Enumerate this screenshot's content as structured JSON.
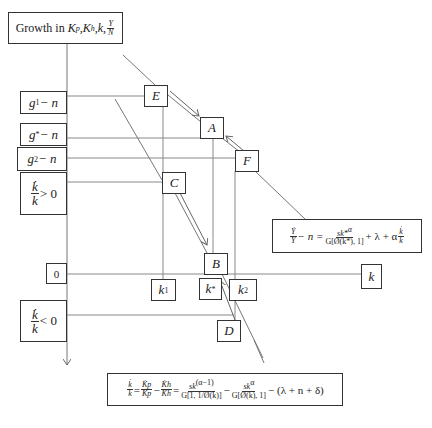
{
  "title": {
    "text_prefix": "Growth in ",
    "vars": "K",
    "sub_p": "p",
    "sub_h": "h",
    "k": "k",
    "frac_num": "Y",
    "frac_den": "N"
  },
  "axis_labels": {
    "g1": {
      "base": "g",
      "sup": "1",
      "rest": " − n"
    },
    "gstar": {
      "base": "g",
      "sup": "*",
      "rest": " − n"
    },
    "g2": {
      "base": "g",
      "sup": "2",
      "rest": " − n"
    },
    "kpos": {
      "num": "k̇",
      "den": "k",
      "rel": "> 0"
    },
    "zero": "0",
    "kneg": {
      "num": "k̇",
      "den": "k",
      "rel": "< 0"
    }
  },
  "points": {
    "E": "E",
    "A": "A",
    "F": "F",
    "C": "C",
    "B": "B",
    "D": "D"
  },
  "k_labels": {
    "k1": {
      "base": "k",
      "sup": "1"
    },
    "kstar": {
      "base": "k",
      "sup": "*"
    },
    "k2": {
      "base": "k",
      "sup": "2"
    },
    "k": "k"
  },
  "equations": {
    "y_growth": {
      "lhs_num": "Ẏ",
      "lhs_den": "Y",
      "minus_n": " − n = ",
      "frac_num": "sk*",
      "frac_num_sup": "α",
      "frac_den": "G[Ø(k*), 1]",
      "tail": " + λ + α",
      "tail_num": "k̇",
      "tail_den": "k"
    },
    "k_growth": {
      "lhs_num": "k̇",
      "lhs_den": "k",
      "kp_num": "K̇p",
      "kp_den": "Kp",
      "kh_num": "K̇h",
      "kh_den": "Kh",
      "term1_num": "sk",
      "term1_sup": "(α−1)",
      "term1_den": "G[1, 1/Ø(k)]",
      "term2_num": "sk",
      "term2_sup": "α",
      "term2_den": "G[Ø(k), 1]",
      "tail": " − (λ + n + δ)"
    }
  },
  "colors": {
    "line": "#777777",
    "border": "#333333"
  }
}
